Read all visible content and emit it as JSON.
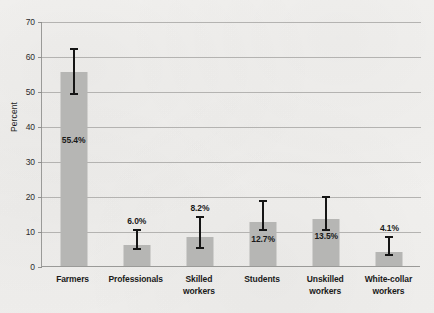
{
  "chart_data": {
    "type": "bar",
    "title": "",
    "xlabel": "",
    "ylabel": "Percent",
    "ylim": [
      0,
      70
    ],
    "ytick_step": 10,
    "yticks": [
      0,
      10,
      20,
      30,
      40,
      50,
      60,
      70
    ],
    "grid": true,
    "legend": "none",
    "value_label_suffix": "%",
    "categories": [
      "Farmers",
      "Professionals",
      "Skilled workers",
      "Students",
      "Unskilled workers",
      "White-collar workers"
    ],
    "category_lines": [
      [
        "Farmers"
      ],
      [
        "Professionals"
      ],
      [
        "Skilled",
        "workers"
      ],
      [
        "Students"
      ],
      [
        "Unskilled",
        "workers"
      ],
      [
        "White-collar",
        "workers"
      ]
    ],
    "values": [
      55.4,
      6.0,
      8.2,
      12.7,
      13.5,
      4.1
    ],
    "value_labels": [
      "55.4%",
      "6.0%",
      "8.2%",
      "12.7%",
      "13.5%",
      "4.1%"
    ],
    "error_bars": {
      "lower": [
        48.8,
        4.5,
        5.0,
        10.0,
        10.0,
        3.0
      ],
      "upper": [
        62.2,
        10.5,
        14.4,
        19.0,
        20.0,
        8.5
      ]
    },
    "colors": {
      "bar_fill": "#b6b6b4",
      "error_bar": "#151515",
      "gridline": "#b4b3b1",
      "axis": "#9a9a98",
      "text": "#1a1a1a",
      "background": "#f1f0ee"
    }
  }
}
